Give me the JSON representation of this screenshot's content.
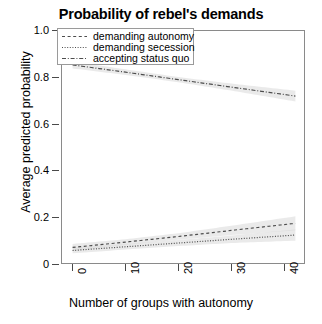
{
  "chart_data": {
    "type": "line",
    "title": "Probability of rebel's demands",
    "xlabel": "Number of groups with autonomy",
    "ylabel": "Average predicted probability",
    "xlim": [
      -2,
      44
    ],
    "ylim": [
      0,
      1.0
    ],
    "xticks": [
      0,
      10,
      20,
      30,
      40
    ],
    "xtick_labels": [
      "0",
      "10",
      "20",
      "30",
      "40"
    ],
    "yticks": [
      0,
      0.2,
      0.4,
      0.6,
      0.8,
      1.0
    ],
    "ytick_labels": [
      "0",
      "0.2",
      "0.4",
      "0.6",
      "0.8",
      "1.0"
    ],
    "grid": false,
    "legend_position": "top-left",
    "series": [
      {
        "name": "demanding autonomy",
        "linestyle": "dashed",
        "color": "#4d4d4d",
        "x": [
          0,
          10,
          20,
          30,
          42
        ],
        "values": [
          0.075,
          0.098,
          0.122,
          0.148,
          0.178
        ],
        "band_upper": [
          0.09,
          0.11,
          0.136,
          0.168,
          0.208
        ],
        "band_lower": [
          0.06,
          0.086,
          0.108,
          0.128,
          0.148
        ]
      },
      {
        "name": "demanding secession",
        "linestyle": "dotted",
        "color": "#4d4d4d",
        "x": [
          0,
          10,
          20,
          30,
          42
        ],
        "values": [
          0.062,
          0.078,
          0.094,
          0.11,
          0.128
        ],
        "band_upper": [
          0.075,
          0.09,
          0.107,
          0.126,
          0.152
        ],
        "band_lower": [
          0.05,
          0.066,
          0.081,
          0.094,
          0.104
        ]
      },
      {
        "name": "accepting status quo",
        "linestyle": "dashdot",
        "color": "#4d4d4d",
        "x": [
          0,
          10,
          20,
          30,
          42
        ],
        "values": [
          0.855,
          0.824,
          0.792,
          0.76,
          0.722
        ],
        "band_upper": [
          0.87,
          0.836,
          0.803,
          0.775,
          0.745
        ],
        "band_lower": [
          0.84,
          0.812,
          0.781,
          0.745,
          0.699
        ]
      }
    ]
  },
  "legend": {
    "items": [
      {
        "label": "demanding autonomy"
      },
      {
        "label": "demanding secession"
      },
      {
        "label": "accepting status quo"
      }
    ]
  }
}
